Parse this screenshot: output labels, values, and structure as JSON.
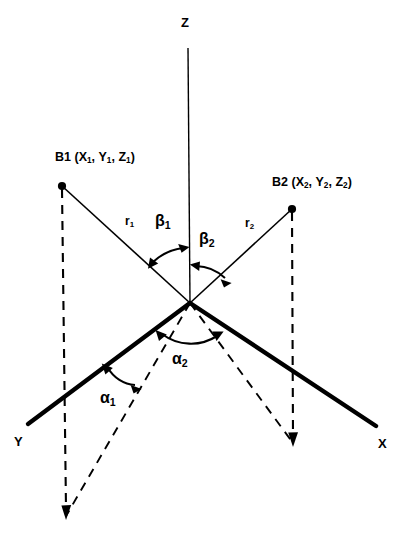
{
  "figure": {
    "background_color": "#ffffff",
    "stroke_color": "#000000",
    "axes": [
      {
        "id": "z",
        "label": "Z",
        "style": "thin-solid"
      },
      {
        "id": "y",
        "label": "Y",
        "style": "thick-solid"
      },
      {
        "id": "x",
        "label": "X",
        "style": "thick-solid"
      }
    ],
    "points": [
      {
        "id": "b1",
        "label_prefix": "B1",
        "label_full": "B1 (X1, Y1, Z1)",
        "name": "B1",
        "coords": [
          "X",
          "Y",
          "Z"
        ],
        "subscript": "1",
        "marker": "filled-dot"
      },
      {
        "id": "b2",
        "label_prefix": "B2",
        "label_full": "B2 (X2, Y2, Z2)",
        "name": "B2",
        "coords": [
          "X",
          "Y",
          "Z"
        ],
        "subscript": "2",
        "marker": "filled-dot"
      }
    ],
    "ranges": [
      {
        "id": "r1",
        "symbol": "r",
        "subscript": "1",
        "from": "origin",
        "to": "B1"
      },
      {
        "id": "r2",
        "symbol": "r",
        "subscript": "2",
        "from": "origin",
        "to": "B2"
      }
    ],
    "angles": [
      {
        "id": "beta1",
        "symbol": "β",
        "subscript": "1",
        "between": [
          "r1",
          "Z"
        ],
        "arc": "double-arrow"
      },
      {
        "id": "beta2",
        "symbol": "β",
        "subscript": "2",
        "between": [
          "Z",
          "r2"
        ],
        "arc": "double-arrow"
      },
      {
        "id": "alpha1",
        "symbol": "α",
        "subscript": "1",
        "between": [
          "Y",
          "B1-projection"
        ],
        "arc": "double-arrow"
      },
      {
        "id": "alpha2",
        "symbol": "α",
        "subscript": "2",
        "between": [
          "B1-projection",
          "B2-projection"
        ],
        "arc": "double-arrow"
      }
    ],
    "projections": [
      {
        "id": "b1-drop",
        "style": "dashed-vertical-arrow",
        "from": "B1",
        "to": "ground-plane"
      },
      {
        "id": "b2-drop",
        "style": "dashed-vertical-arrow",
        "from": "B2",
        "to": "ground-plane"
      },
      {
        "id": "b1-ground",
        "style": "dashed",
        "from": "origin",
        "to": "b1-ground-point"
      },
      {
        "id": "b2-ground",
        "style": "dashed",
        "from": "origin",
        "to": "b2-ground-point"
      }
    ]
  }
}
